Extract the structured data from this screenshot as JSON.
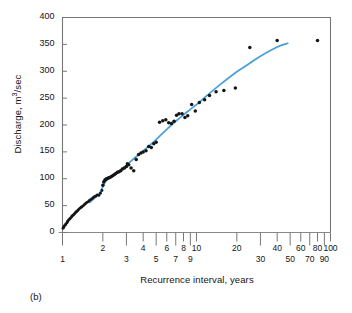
{
  "figure": {
    "panel_label": "(b)",
    "xlabel": "Recurrence interval, years",
    "ylabel_prefix": "Discharge, m",
    "ylabel_sup": "3",
    "ylabel_suffix": "/sec",
    "line_color": "#4a9fd4",
    "point_color": "#151515",
    "axis_color": "#555555"
  },
  "chart_data": {
    "type": "scatter",
    "title": "",
    "subtitle": "",
    "panel": "(b)",
    "xlabel": "Recurrence interval, years",
    "ylabel": "Discharge, m3/sec",
    "xscale": "log",
    "yscale": "linear",
    "xlim": [
      1,
      100
    ],
    "ylim": [
      0,
      400
    ],
    "grid": false,
    "legend": null,
    "yticks": [
      0,
      50,
      100,
      150,
      200,
      250,
      300,
      350,
      400
    ],
    "ytick_labels": [
      "0",
      "50",
      "100",
      "150",
      "200",
      "250",
      "300",
      "350",
      "400"
    ],
    "xticks": [
      1,
      2,
      3,
      4,
      5,
      6,
      7,
      8,
      9,
      10,
      20,
      30,
      40,
      50,
      60,
      70,
      80,
      90,
      100
    ],
    "xtick_labels_upper": [
      "2",
      "4",
      "6",
      "8",
      "10",
      "20",
      "40",
      "60",
      "80",
      "100"
    ],
    "xtick_labels_lower": [
      "1",
      "3",
      "5",
      "7",
      "9",
      "30",
      "50",
      "70",
      "90"
    ],
    "series": [
      {
        "name": "Annual peak discharge",
        "marker": "dot",
        "color": "#151515",
        "points": [
          [
            1.01,
            8
          ],
          [
            1.02,
            10
          ],
          [
            1.03,
            12
          ],
          [
            1.05,
            14
          ],
          [
            1.06,
            16
          ],
          [
            1.08,
            18
          ],
          [
            1.09,
            20
          ],
          [
            1.1,
            22
          ],
          [
            1.12,
            24
          ],
          [
            1.13,
            25
          ],
          [
            1.15,
            27
          ],
          [
            1.17,
            29
          ],
          [
            1.18,
            31
          ],
          [
            1.2,
            32
          ],
          [
            1.22,
            34
          ],
          [
            1.24,
            36
          ],
          [
            1.26,
            38
          ],
          [
            1.28,
            39
          ],
          [
            1.3,
            41
          ],
          [
            1.32,
            43
          ],
          [
            1.35,
            45
          ],
          [
            1.38,
            47
          ],
          [
            1.4,
            48
          ],
          [
            1.43,
            50
          ],
          [
            1.46,
            52
          ],
          [
            1.49,
            54
          ],
          [
            1.52,
            56
          ],
          [
            1.55,
            57
          ],
          [
            1.58,
            59
          ],
          [
            1.62,
            61
          ],
          [
            1.66,
            63
          ],
          [
            1.7,
            65
          ],
          [
            1.74,
            67
          ],
          [
            1.78,
            68
          ],
          [
            1.82,
            70
          ],
          [
            1.87,
            69
          ],
          [
            1.92,
            73
          ],
          [
            1.97,
            78
          ],
          [
            2.0,
            88
          ],
          [
            2.03,
            94
          ],
          [
            2.07,
            97
          ],
          [
            2.1,
            99
          ],
          [
            2.14,
            100
          ],
          [
            2.18,
            101
          ],
          [
            2.22,
            102
          ],
          [
            2.27,
            103
          ],
          [
            2.32,
            104
          ],
          [
            2.38,
            106
          ],
          [
            2.44,
            108
          ],
          [
            2.5,
            110
          ],
          [
            2.57,
            112
          ],
          [
            2.64,
            113
          ],
          [
            2.72,
            115
          ],
          [
            2.8,
            118
          ],
          [
            2.9,
            120
          ],
          [
            3.0,
            123
          ],
          [
            3.05,
            128
          ],
          [
            3.12,
            126
          ],
          [
            3.25,
            120
          ],
          [
            3.4,
            115
          ],
          [
            3.55,
            136
          ],
          [
            3.7,
            145
          ],
          [
            3.85,
            148
          ],
          [
            4.0,
            150
          ],
          [
            4.2,
            152
          ],
          [
            4.4,
            160
          ],
          [
            4.6,
            158
          ],
          [
            4.8,
            165
          ],
          [
            5.0,
            168
          ],
          [
            5.3,
            205
          ],
          [
            5.6,
            208
          ],
          [
            5.9,
            210
          ],
          [
            6.2,
            204
          ],
          [
            6.5,
            203
          ],
          [
            6.8,
            207
          ],
          [
            7.1,
            218
          ],
          [
            7.4,
            221
          ],
          [
            7.8,
            221
          ],
          [
            8.2,
            214
          ],
          [
            8.6,
            217
          ],
          [
            9.2,
            238
          ],
          [
            9.8,
            226
          ],
          [
            10.5,
            242
          ],
          [
            11.5,
            247
          ],
          [
            12.5,
            255
          ],
          [
            14.0,
            262
          ],
          [
            16.0,
            264
          ],
          [
            19.5,
            269
          ],
          [
            25.0,
            344
          ],
          [
            40.0,
            357
          ],
          [
            80.0,
            357
          ]
        ]
      }
    ],
    "fit_line": {
      "name": "Fitted frequency curve",
      "color": "#4a9fd4",
      "points": [
        [
          1.6,
          56
        ],
        [
          1.9,
          74
        ],
        [
          2.1,
          95
        ],
        [
          2.5,
          110
        ],
        [
          3.0,
          125
        ],
        [
          3.5,
          140
        ],
        [
          4.0,
          152
        ],
        [
          5.0,
          173
        ],
        [
          6.0,
          192
        ],
        [
          7.0,
          207
        ],
        [
          8.0,
          219
        ],
        [
          9.0,
          229
        ],
        [
          10.0,
          238
        ],
        [
          12.0,
          255
        ],
        [
          15.0,
          275
        ],
        [
          20.0,
          299
        ],
        [
          25.0,
          315
        ],
        [
          30.0,
          328
        ],
        [
          40.0,
          345
        ],
        [
          48.0,
          352
        ]
      ]
    }
  }
}
